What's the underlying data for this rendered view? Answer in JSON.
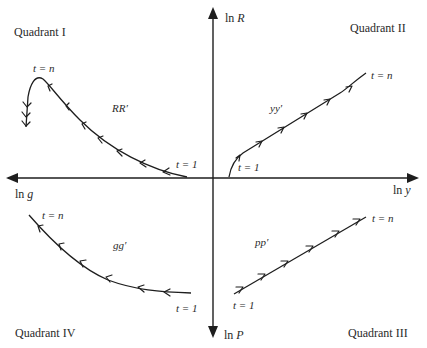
{
  "diagram": {
    "quadrants": {
      "q1": "Quadrant I",
      "q2": "Quadrant II",
      "q3": "Quadrant III",
      "q4": "Quadrant IV"
    },
    "axes": {
      "up": {
        "prefix": "ln ",
        "var": "R"
      },
      "down": {
        "prefix": "ln ",
        "var": "P"
      },
      "left": {
        "prefix": "ln ",
        "var": "g"
      },
      "right": {
        "prefix": "ln ",
        "var": "y"
      }
    },
    "curves": [
      {
        "id": "RR",
        "label": "RR′",
        "quadrant": "I",
        "start_label": "t = 1",
        "end_label": "t = n",
        "direction": "from origin outward to upper-left, hooking down"
      },
      {
        "id": "yy",
        "label": "yy′",
        "quadrant": "II",
        "start_label": "t = 1",
        "end_label": "t = n",
        "direction": "from origin outward to upper-right"
      },
      {
        "id": "pp",
        "label": "pp′",
        "quadrant": "III",
        "start_label": "t = 1",
        "end_label": "t = n",
        "direction": "lower-left to upper-right"
      },
      {
        "id": "gg",
        "label": "gg′",
        "quadrant": "IV",
        "start_label": "t = 1",
        "end_label": "t = n",
        "direction": "right to upper-left"
      }
    ],
    "colors": {
      "ink": "#1e1e1e",
      "background": "#ffffff"
    }
  }
}
